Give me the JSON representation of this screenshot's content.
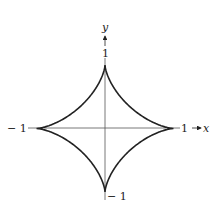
{
  "figure": {
    "curve": "astroid",
    "equation": "x^(2/3) + y^(2/3) = 1",
    "axes": {
      "x_label": "x",
      "y_label": "y"
    },
    "tick_labels": {
      "top": "1",
      "bottom": "− 1",
      "left": "− 1",
      "right": "1"
    },
    "colors": {
      "curve": "#222222",
      "axes": "#555555",
      "background": "#ffffff"
    }
  }
}
